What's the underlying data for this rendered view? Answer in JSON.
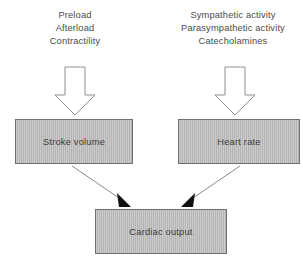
{
  "diagram": {
    "background_color": "#ffffff",
    "box_fill_color": "#b4b4b4",
    "box_border_color": "#6f6f6f",
    "text_color": "#4a4a4a",
    "arrow_outline_color": "#8a8a8a",
    "connector_color": "#8a8a8a",
    "arrowhead_color": "#111111"
  },
  "inputs": {
    "left": {
      "lines": [
        "Preload",
        "Afterload",
        "Contractility"
      ],
      "line1": "Preload",
      "line2": "Afterload",
      "line3": "Contractility"
    },
    "right": {
      "lines": [
        "Sympathetic activity",
        "Parasympathetic activity",
        "Catecholamines"
      ],
      "line1": "Sympathetic activity",
      "line2": "Parasympathetic activity",
      "line3": "Catecholamines"
    }
  },
  "nodes": {
    "stroke_volume": "Stroke volume",
    "heart_rate": "Heart rate",
    "cardiac_output": "Cardiac output"
  },
  "arrows": {
    "block_arrow_left": "down-block-arrow",
    "block_arrow_right": "down-block-arrow",
    "connector_left": "arrow-stroke-volume-to-cardiac-output",
    "connector_right": "arrow-heart-rate-to-cardiac-output"
  }
}
